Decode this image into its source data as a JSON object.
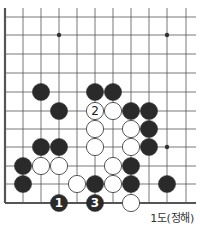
{
  "diagram": {
    "caption": "1도(정해)",
    "grid": {
      "columns_x": [
        5,
        23,
        41,
        59,
        77,
        95,
        113,
        131,
        149,
        167,
        186
      ],
      "rows_y": [
        17,
        35,
        54,
        73,
        92,
        111,
        129,
        147,
        166,
        184,
        203
      ],
      "top_extend_y": 8,
      "right_extend_x": 196,
      "left_edge": "thick",
      "bottom_edge": "thick",
      "line_color": "#555555"
    },
    "star_points": [
      {
        "col": 3,
        "row": 1
      },
      {
        "col": 9,
        "row": 1
      },
      {
        "col": 9,
        "row": 7
      }
    ],
    "stones": [
      {
        "color": "black",
        "col": 2,
        "row": 4,
        "label": ""
      },
      {
        "color": "black",
        "col": 5,
        "row": 4,
        "label": ""
      },
      {
        "color": "black",
        "col": 6,
        "row": 4,
        "label": ""
      },
      {
        "color": "black",
        "col": 3,
        "row": 5,
        "label": ""
      },
      {
        "color": "white",
        "col": 5,
        "row": 5,
        "label": "2"
      },
      {
        "color": "white",
        "col": 6,
        "row": 5,
        "label": ""
      },
      {
        "color": "black",
        "col": 7,
        "row": 5,
        "label": ""
      },
      {
        "color": "black",
        "col": 8,
        "row": 5,
        "label": ""
      },
      {
        "color": "white",
        "col": 5,
        "row": 6,
        "label": ""
      },
      {
        "color": "white",
        "col": 7,
        "row": 6,
        "label": ""
      },
      {
        "color": "black",
        "col": 8,
        "row": 6,
        "label": ""
      },
      {
        "color": "black",
        "col": 2,
        "row": 7,
        "label": ""
      },
      {
        "color": "black",
        "col": 3,
        "row": 7,
        "label": ""
      },
      {
        "color": "white",
        "col": 5,
        "row": 7,
        "label": ""
      },
      {
        "color": "white",
        "col": 7,
        "row": 7,
        "label": ""
      },
      {
        "color": "black",
        "col": 8,
        "row": 7,
        "label": ""
      },
      {
        "color": "black",
        "col": 1,
        "row": 8,
        "label": ""
      },
      {
        "color": "white",
        "col": 2,
        "row": 8,
        "label": ""
      },
      {
        "color": "white",
        "col": 3,
        "row": 8,
        "label": ""
      },
      {
        "color": "white",
        "col": 6,
        "row": 8,
        "label": ""
      },
      {
        "color": "black",
        "col": 7,
        "row": 8,
        "label": ""
      },
      {
        "color": "black",
        "col": 1,
        "row": 9,
        "label": ""
      },
      {
        "color": "white",
        "col": 4,
        "row": 9,
        "label": ""
      },
      {
        "color": "black",
        "col": 5,
        "row": 9,
        "label": ""
      },
      {
        "color": "white",
        "col": 6,
        "row": 9,
        "label": ""
      },
      {
        "color": "black",
        "col": 7,
        "row": 9,
        "label": ""
      },
      {
        "color": "black",
        "col": 9,
        "row": 9,
        "label": ""
      },
      {
        "color": "black",
        "col": 3,
        "row": 10,
        "label": "1"
      },
      {
        "color": "black",
        "col": 5,
        "row": 10,
        "label": "3"
      },
      {
        "color": "white",
        "col": 7,
        "row": 10,
        "label": ""
      }
    ],
    "colors": {
      "black_stone": "#2a2a2a",
      "white_stone": "#ffffff",
      "white_stroke": "#444444",
      "label_on_black": "#ffffff",
      "label_on_white": "#222222"
    }
  }
}
